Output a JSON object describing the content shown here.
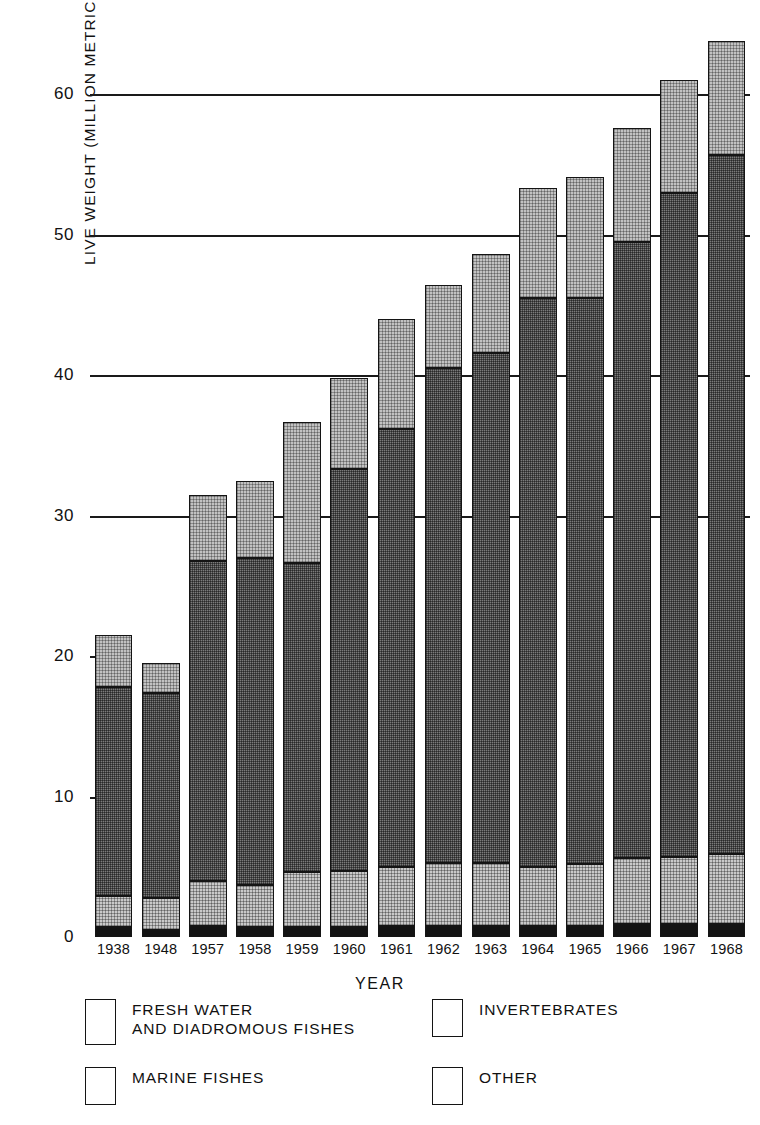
{
  "chart_data": {
    "type": "bar",
    "subtype": "stacked-vertical",
    "title": "",
    "xlabel": "YEAR",
    "ylabel": "LIVE WEIGHT (MILLION METRIC TONS)",
    "categories": [
      "1938",
      "1948",
      "1957",
      "1958",
      "1959",
      "1960",
      "1961",
      "1962",
      "1963",
      "1964",
      "1965",
      "1966",
      "1967",
      "1968"
    ],
    "ylim": [
      0,
      66
    ],
    "yticks": [
      0,
      10,
      20,
      30,
      40,
      50,
      60
    ],
    "ytick_labels": [
      "0",
      "10",
      "20",
      "30",
      "40",
      "50",
      "60"
    ],
    "gridlines_at": [
      30,
      40,
      50,
      60
    ],
    "grid": true,
    "legend_position": "below-plot",
    "series": [
      {
        "name": "OTHER",
        "key": "other",
        "color": "#131313",
        "values": [
          0.7,
          0.5,
          0.8,
          0.7,
          0.7,
          0.7,
          0.8,
          0.8,
          0.8,
          0.8,
          0.8,
          0.9,
          0.9,
          0.9
        ]
      },
      {
        "name": "FRESH WATER\nAND DIADROMOUS FISHES",
        "key": "fresh",
        "color": "#c9c9c9",
        "values": [
          2.2,
          2.3,
          3.2,
          3.0,
          3.9,
          4.0,
          4.2,
          4.5,
          4.5,
          4.2,
          4.4,
          4.7,
          4.8,
          5.0
        ]
      },
      {
        "name": "MARINE FISHES",
        "key": "marine",
        "color": "#7b7b7b",
        "values": [
          14.9,
          14.6,
          22.8,
          23.3,
          22.0,
          28.6,
          31.2,
          35.2,
          36.3,
          40.5,
          40.3,
          43.9,
          47.3,
          49.8
        ]
      },
      {
        "name": "INVERTEBRATES",
        "key": "invert",
        "color": "#c2c2c2",
        "values": [
          3.7,
          2.1,
          4.7,
          5.5,
          10.1,
          6.5,
          7.8,
          5.9,
          7.0,
          7.8,
          8.6,
          8.1,
          8.0,
          8.1
        ]
      }
    ],
    "totals": [
      21.5,
      19.5,
      31.5,
      32.5,
      36.7,
      39.8,
      44.0,
      46.4,
      48.6,
      53.3,
      54.1,
      57.6,
      61.0,
      63.8
    ],
    "annotations": []
  },
  "axis": {
    "y_title": "LIVE WEIGHT (MILLION METRIC TONS)",
    "x_title": "YEAR"
  },
  "legend": {
    "items": [
      {
        "label": "FRESH WATER\nAND DIADROMOUS FISHES",
        "swatch": "fresh"
      },
      {
        "label": "INVERTEBRATES",
        "swatch": "invert"
      },
      {
        "label": "MARINE FISHES",
        "swatch": "marine"
      },
      {
        "label": "OTHER",
        "swatch": "other"
      }
    ]
  }
}
